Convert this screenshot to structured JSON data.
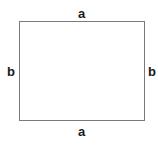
{
  "diagram": {
    "shape": "rectangle",
    "labels": {
      "top": "a",
      "bottom": "a",
      "left": "b",
      "right": "b"
    },
    "colors": {
      "stroke": "#7a7a7a",
      "label": "#1a1a1a",
      "background": "#ffffff"
    }
  }
}
